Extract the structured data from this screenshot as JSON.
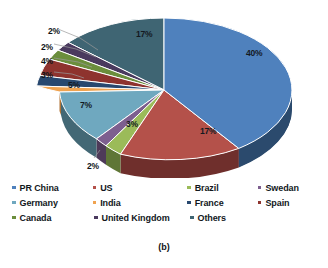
{
  "figure": {
    "caption": "(b)"
  },
  "chart_data": {
    "type": "pie",
    "title": "",
    "legend_position": "bottom",
    "grid": false,
    "value_unit": "%",
    "categories": [
      "PR China",
      "US",
      "Brazil",
      "Swedan",
      "Germany",
      "India",
      "France",
      "Spain",
      "Canada",
      "United Kingdom",
      "Others"
    ],
    "values": [
      40,
      17,
      3,
      2,
      7,
      5,
      3,
      4,
      2,
      2,
      17
    ],
    "labels": [
      "40%",
      "17%",
      "3%",
      "2%",
      "7%",
      "5%",
      "3%",
      "4%",
      "2%",
      "2%",
      "17%"
    ],
    "colors": [
      "#4f81bd",
      "#b4514a",
      "#9bbb59",
      "#7d5f8f",
      "#6fa8bf",
      "#f0a350",
      "#28486f",
      "#8e332e",
      "#6b8e3c",
      "#4a3a5e",
      "#3f6573"
    ],
    "side_colors": [
      "#2e4f73",
      "#6f2f2c",
      "#5f7636",
      "#4e3a59",
      "#436875",
      "#b07234",
      "#17304b",
      "#5a1f1c",
      "#42591f",
      "#2c2239",
      "#27414b"
    ],
    "label_placement": [
      "inside",
      "inside",
      "inside",
      "outside",
      "inside",
      "inside",
      "outside",
      "outside",
      "outside",
      "outside",
      "inside"
    ]
  },
  "legend": {
    "rows": [
      [
        {
          "label": "PR China",
          "color": "#4f81bd"
        },
        {
          "label": "US",
          "color": "#b4514a"
        },
        {
          "label": "Brazil",
          "color": "#9bbb59"
        },
        {
          "label": "Swedan",
          "color": "#7d5f8f"
        }
      ],
      [
        {
          "label": "Germany",
          "color": "#6fa8bf"
        },
        {
          "label": "India",
          "color": "#f0a350"
        },
        {
          "label": "France",
          "color": "#28486f"
        },
        {
          "label": "Spain",
          "color": "#8e332e"
        }
      ],
      [
        {
          "label": "Canada",
          "color": "#6b8e3c"
        },
        {
          "label": "United Kingdom",
          "color": "#4a3a5e"
        },
        {
          "label": "Others",
          "color": "#3f6573"
        }
      ]
    ]
  },
  "pct_labels_inside": [
    {
      "name": "pct-pr-china",
      "text": "40%",
      "x": 246,
      "y": 46
    },
    {
      "name": "pct-us",
      "text": "17%",
      "x": 200,
      "y": 124
    },
    {
      "name": "pct-brazil",
      "text": "3%",
      "x": 126,
      "y": 117
    },
    {
      "name": "pct-germany",
      "text": "7%",
      "x": 80,
      "y": 98
    },
    {
      "name": "pct-india",
      "text": "5%",
      "x": 68,
      "y": 78
    },
    {
      "name": "pct-others",
      "text": "17%",
      "x": 136,
      "y": 27
    }
  ],
  "pct_labels_outside": [
    {
      "name": "pct-united-kingdom",
      "text": "2%",
      "x": 48,
      "y": 24
    },
    {
      "name": "pct-canada",
      "text": "2%",
      "x": 41,
      "y": 40
    },
    {
      "name": "pct-spain",
      "text": "4%",
      "x": 41,
      "y": 54
    },
    {
      "name": "pct-france",
      "text": "3%",
      "x": 41,
      "y": 68
    },
    {
      "name": "pct-swedan",
      "text": "2%",
      "x": 87,
      "y": 159
    }
  ]
}
